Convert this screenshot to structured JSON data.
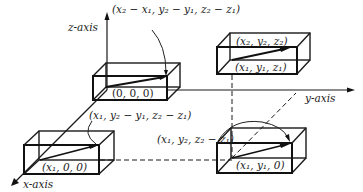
{
  "axes": {
    "z_label": "z-axis",
    "y_label": "y-axis",
    "x_label": "x-axis"
  },
  "boxes": {
    "origin_box": {
      "label": "(0, 0, 0)"
    },
    "x_box": {
      "label": "(x₁, 0, 0)"
    },
    "top_right_box": {
      "label_top": "(x₂, y₂, z₂)",
      "label_bottom": "(x₁, y₁, z₁)"
    },
    "bottom_right_box": {
      "label": "(x₁, y₁, 0)"
    }
  },
  "annotations": {
    "translated_vector": "(x₂ − x₁, y₂ − y₁, z₂ − z₁)",
    "x_box_vector": "(x₁, y₂ − y₁, z₂ − z₁)",
    "rotated_vector": "(x₁, y₂, z₂ − z₁)"
  },
  "colors": {
    "line": "#1a1a1a",
    "background": "#ffffff"
  }
}
